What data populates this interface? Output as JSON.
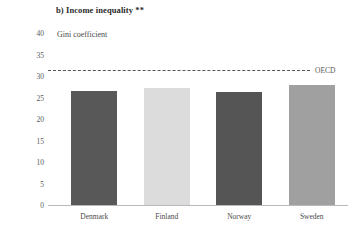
{
  "chart_data": {
    "type": "bar",
    "title": "b) Income inequality **",
    "ylabel": "Gini coefficient",
    "xlabel": "",
    "categories": [
      "Denmark",
      "Finland",
      "Norway",
      "Sweden"
    ],
    "values": [
      26.5,
      27.3,
      26.3,
      27.8
    ],
    "bar_colors": [
      "#585858",
      "#dcdcdc",
      "#555555",
      "#a0a0a0"
    ],
    "ylim": [
      0,
      40
    ],
    "yticks": [
      40,
      35,
      30,
      25,
      20,
      15,
      10,
      5,
      0
    ],
    "ytick_labels": [
      "40",
      "35",
      "30",
      "25",
      "20",
      "15",
      "10",
      "5",
      "0"
    ],
    "grid": false,
    "legend_position": "none",
    "annotations": [
      {
        "name": "oecd-reference-line",
        "label": "OECD",
        "value": 31.5,
        "style": "dashed",
        "color": "#555555"
      }
    ]
  }
}
